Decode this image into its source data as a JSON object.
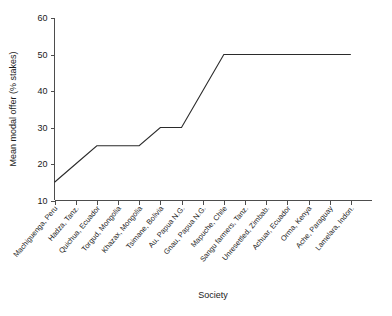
{
  "chart_data": {
    "type": "line",
    "title": "",
    "xlabel": "Society",
    "ylabel": "Mean modal offer (% stakes)",
    "ylim": [
      10,
      60
    ],
    "yticks": [
      10,
      20,
      30,
      40,
      50,
      60
    ],
    "grid": false,
    "legend": false,
    "legend_position": "none",
    "line_color": "#2b2b2b",
    "categories": [
      "Machiguenga, Peru",
      "Hadza, Tanz.",
      "Quichua, Ecuador",
      "Torgud, Mongolia",
      "Khazax, Mongolia",
      "Tsimane, Bolivia",
      "Au, Papua N.G.",
      "Gnau, Papua N.G.",
      "Mapuche, Chile",
      "Sangu farmers, Tanz.",
      "Unresettled, Zimbab.",
      "Achuar, Ecuador",
      "Orma, Kenya",
      "Ache, Paraguay",
      "Lamelara, Indon."
    ],
    "values": [
      15,
      20,
      25,
      25,
      25,
      30,
      30,
      40,
      50,
      50,
      50,
      50,
      50,
      50,
      50
    ],
    "series": [
      {
        "name": "Mean modal offer",
        "values": [
          15,
          20,
          25,
          25,
          25,
          30,
          30,
          40,
          50,
          50,
          50,
          50,
          50,
          50,
          50
        ]
      }
    ]
  },
  "axes": {
    "y_title": "Mean modal offer (% stakes)",
    "x_title": "Society",
    "y_tick_labels": [
      "10",
      "20",
      "30",
      "40",
      "50",
      "60"
    ]
  }
}
